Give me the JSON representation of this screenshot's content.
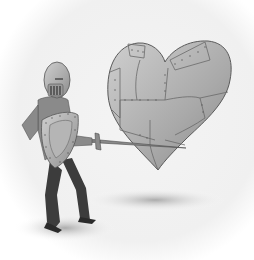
{
  "image": {
    "width": 254,
    "height": 260,
    "style": "grayscale illustration",
    "subjects": [
      {
        "name": "knight",
        "description": "knight in helmet holding a shield and a sword"
      },
      {
        "name": "armored-heart",
        "description": "large heart made of riveted metal plates, pierced by the sword"
      },
      {
        "name": "ground-shadow",
        "description": "soft gray shadow beneath the figures"
      }
    ]
  },
  "colors": {
    "background": "#ffffff",
    "vignette": "#ececec",
    "metal_light": "#c9c9c9",
    "metal_mid": "#a8a8a8",
    "metal_dark": "#7d7d7d",
    "outline": "#555555",
    "tunic": "#8a8a8a",
    "legs": "#3c3c3c",
    "shadow": "#9a9a9a",
    "rivet": "#5a5a5a"
  }
}
